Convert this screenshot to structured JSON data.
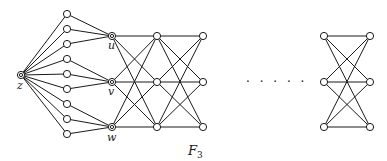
{
  "diagram": {
    "type": "graph",
    "colors": {
      "stroke": "#1a1a1a",
      "background": "#ffffff"
    },
    "labels": {
      "z": "z",
      "u": "u",
      "v": "v",
      "w": "w",
      "caption_main": "F",
      "caption_sub": "3",
      "ellipsis": "· · · · ·"
    },
    "nodes": {
      "z": {
        "x": 21,
        "y": 75,
        "style": "marked"
      },
      "fan": [
        {
          "x": 67,
          "y": 14
        },
        {
          "x": 67,
          "y": 29
        },
        {
          "x": 67,
          "y": 44
        },
        {
          "x": 67,
          "y": 59
        },
        {
          "x": 67,
          "y": 74
        },
        {
          "x": 67,
          "y": 89
        },
        {
          "x": 67,
          "y": 104
        },
        {
          "x": 67,
          "y": 119
        },
        {
          "x": 67,
          "y": 134
        }
      ],
      "u": {
        "x": 112,
        "y": 36,
        "style": "marked"
      },
      "v": {
        "x": 112,
        "y": 82,
        "style": "marked"
      },
      "w": {
        "x": 112,
        "y": 127,
        "style": "marked"
      },
      "col2": [
        {
          "x": 157,
          "y": 36
        },
        {
          "x": 157,
          "y": 82
        },
        {
          "x": 157,
          "y": 127
        }
      ],
      "col3": [
        {
          "x": 203,
          "y": 36
        },
        {
          "x": 203,
          "y": 82
        },
        {
          "x": 203,
          "y": 127
        }
      ],
      "right_left": [
        {
          "x": 324,
          "y": 36
        },
        {
          "x": 324,
          "y": 82
        },
        {
          "x": 324,
          "y": 127
        }
      ],
      "right_right": [
        {
          "x": 370,
          "y": 36
        },
        {
          "x": 370,
          "y": 82
        },
        {
          "x": 370,
          "y": 127
        }
      ]
    },
    "structure": "z joins 9 fan vertices; fan groups of 3 join u, v, w; successive columns joined as complete bipartite K3,3; ellipsis; final K3,3 block"
  }
}
